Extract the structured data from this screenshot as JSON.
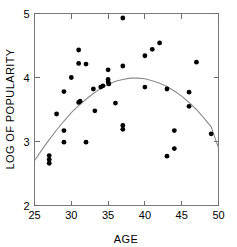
{
  "chart_data": {
    "type": "scatter",
    "title": "",
    "xlabel": "AGE",
    "ylabel": "LOG OF POPULARITY",
    "xlim": [
      25,
      50
    ],
    "ylim": [
      2,
      5
    ],
    "xticks": [
      25,
      30,
      35,
      40,
      45,
      50
    ],
    "yticks": [
      2,
      3,
      4,
      5
    ],
    "xtick_labels": [
      "25",
      "30",
      "35",
      "40",
      "45",
      "50"
    ],
    "ytick_labels": [
      "2",
      "3",
      "4",
      "5"
    ],
    "grid": false,
    "legend": null,
    "frame": "box-with-mirrored-inward-ticks",
    "point_color": "#000000",
    "curve_color": "#8a8a8a",
    "points": [
      {
        "x": 27.0,
        "y": 2.78
      },
      {
        "x": 27.0,
        "y": 2.72
      },
      {
        "x": 27.0,
        "y": 2.66
      },
      {
        "x": 28.0,
        "y": 3.43
      },
      {
        "x": 29.0,
        "y": 3.78
      },
      {
        "x": 29.0,
        "y": 3.17
      },
      {
        "x": 29.0,
        "y": 2.99
      },
      {
        "x": 30.0,
        "y": 4.0
      },
      {
        "x": 31.0,
        "y": 4.43
      },
      {
        "x": 31.0,
        "y": 4.22
      },
      {
        "x": 31.0,
        "y": 3.61
      },
      {
        "x": 31.2,
        "y": 3.63
      },
      {
        "x": 32.0,
        "y": 4.21
      },
      {
        "x": 32.0,
        "y": 2.99
      },
      {
        "x": 33.0,
        "y": 3.82
      },
      {
        "x": 33.2,
        "y": 3.48
      },
      {
        "x": 34.0,
        "y": 3.85
      },
      {
        "x": 34.3,
        "y": 3.87
      },
      {
        "x": 35.0,
        "y": 4.12
      },
      {
        "x": 35.0,
        "y": 3.97
      },
      {
        "x": 35.0,
        "y": 3.93
      },
      {
        "x": 35.1,
        "y": 3.9
      },
      {
        "x": 36.0,
        "y": 3.6
      },
      {
        "x": 37.0,
        "y": 4.93
      },
      {
        "x": 37.0,
        "y": 4.18
      },
      {
        "x": 37.0,
        "y": 3.25
      },
      {
        "x": 37.0,
        "y": 3.19
      },
      {
        "x": 40.0,
        "y": 4.34
      },
      {
        "x": 40.0,
        "y": 3.85
      },
      {
        "x": 41.0,
        "y": 4.44
      },
      {
        "x": 42.0,
        "y": 4.54
      },
      {
        "x": 43.0,
        "y": 3.82
      },
      {
        "x": 43.0,
        "y": 2.77
      },
      {
        "x": 44.0,
        "y": 3.17
      },
      {
        "x": 44.0,
        "y": 2.89
      },
      {
        "x": 46.0,
        "y": 3.77
      },
      {
        "x": 46.0,
        "y": 3.55
      },
      {
        "x": 47.0,
        "y": 4.24
      },
      {
        "x": 49.0,
        "y": 3.12
      }
    ],
    "fit_curve": {
      "name": "quadratic-fit",
      "vertex_x": 38.3,
      "vertex_y": 3.99,
      "points": [
        {
          "x": 25.0,
          "y": 2.7
        },
        {
          "x": 26.0,
          "y": 2.87
        },
        {
          "x": 27.0,
          "y": 3.03
        },
        {
          "x": 28.0,
          "y": 3.18
        },
        {
          "x": 29.0,
          "y": 3.32
        },
        {
          "x": 30.0,
          "y": 3.45
        },
        {
          "x": 31.0,
          "y": 3.56
        },
        {
          "x": 32.0,
          "y": 3.66
        },
        {
          "x": 33.0,
          "y": 3.75
        },
        {
          "x": 34.0,
          "y": 3.83
        },
        {
          "x": 35.0,
          "y": 3.89
        },
        {
          "x": 36.0,
          "y": 3.94
        },
        {
          "x": 37.0,
          "y": 3.97
        },
        {
          "x": 38.0,
          "y": 3.99
        },
        {
          "x": 39.0,
          "y": 3.99
        },
        {
          "x": 40.0,
          "y": 3.98
        },
        {
          "x": 41.0,
          "y": 3.95
        },
        {
          "x": 42.0,
          "y": 3.91
        },
        {
          "x": 43.0,
          "y": 3.86
        },
        {
          "x": 44.0,
          "y": 3.79
        },
        {
          "x": 45.0,
          "y": 3.71
        },
        {
          "x": 46.0,
          "y": 3.61
        },
        {
          "x": 47.0,
          "y": 3.5
        },
        {
          "x": 48.0,
          "y": 3.37
        },
        {
          "x": 49.0,
          "y": 3.23
        },
        {
          "x": 50.0,
          "y": 2.9
        }
      ]
    }
  }
}
